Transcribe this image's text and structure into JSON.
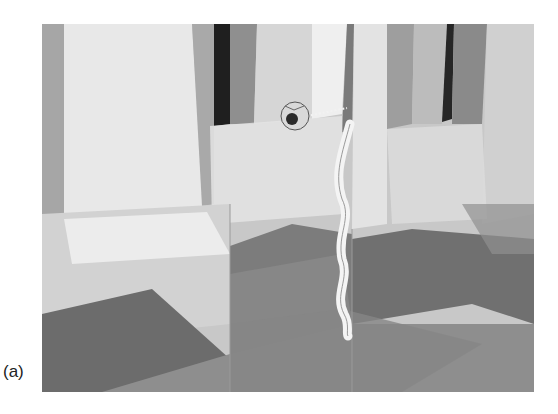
{
  "figure": {
    "panel_label": "(a)",
    "colors": {
      "background": "#ffffff",
      "light_panel": "#e6e6e6",
      "mid_panel": "#a8a8a8",
      "dark_stripe": "#1e1e1e",
      "floor_dark": "#6e6e6e",
      "floor_mid": "#8c8c8c"
    },
    "objects": [
      {
        "name": "sphere",
        "cx": 253,
        "cy": 92,
        "r": 14
      },
      {
        "name": "ribbon-streak",
        "x_range": [
          290,
          318
        ],
        "y_range": [
          100,
          312
        ]
      }
    ]
  }
}
